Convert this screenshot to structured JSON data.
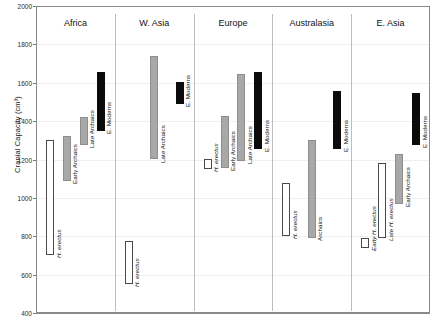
{
  "chart_data": {
    "type": "bar",
    "title": "",
    "xlabel": "",
    "ylabel": "Cranial Capacity (cm³)",
    "ylim": [
      400,
      2000
    ],
    "ytick_labels": [
      "400",
      "600",
      "800",
      "1000",
      "1200",
      "1400",
      "1600",
      "1800",
      "2000"
    ],
    "yticks": [
      400,
      600,
      800,
      1000,
      1200,
      1400,
      1600,
      1800,
      2000
    ],
    "grid": true,
    "legend": "none",
    "note": "Floating range bars: each bar spans min-max cranial capacity for a hominin group within a region.",
    "categories": [
      "Africa",
      "W. Asia",
      "Europe",
      "Australasia",
      "E. Asia"
    ],
    "fills": {
      "white": "#ffffff",
      "gray": "#a8a8a8",
      "black": "#0b0b0b"
    },
    "groups": [
      {
        "name": "Africa",
        "bars": [
          {
            "label": "H. erectus",
            "italic": true,
            "fill": "white",
            "min": 700,
            "max": 1300
          },
          {
            "label": "Early Archaics",
            "italic": false,
            "fill": "gray",
            "min": 1090,
            "max": 1325
          },
          {
            "label": "Late Archaics",
            "italic": false,
            "fill": "gray",
            "min": 1275,
            "max": 1420
          },
          {
            "label": "E. Moderns",
            "italic": false,
            "fill": "black",
            "min": 1350,
            "max": 1655
          }
        ]
      },
      {
        "name": "W. Asia",
        "bars": [
          {
            "label": "H. erectus",
            "italic": true,
            "fill": "white",
            "min": 550,
            "max": 775
          },
          {
            "label": "Late Archaics",
            "italic": false,
            "fill": "gray",
            "min": 1200,
            "max": 1740
          },
          {
            "label": "E. Moderns",
            "italic": false,
            "fill": "black",
            "min": 1490,
            "max": 1605
          }
        ]
      },
      {
        "name": "Europe",
        "bars": [
          {
            "label": "H. erectus",
            "italic": true,
            "fill": "white",
            "min": 1150,
            "max": 1205
          },
          {
            "label": "Early Archaics",
            "italic": false,
            "fill": "gray",
            "min": 1155,
            "max": 1425
          },
          {
            "label": "Late Archaics",
            "italic": false,
            "fill": "gray",
            "min": 1190,
            "max": 1645
          },
          {
            "label": "E. Moderns",
            "italic": false,
            "fill": "black",
            "min": 1255,
            "max": 1655
          }
        ]
      },
      {
        "name": "Australasia",
        "bars": [
          {
            "label": "H. erectus",
            "italic": true,
            "fill": "white",
            "min": 800,
            "max": 1080
          },
          {
            "label": "Archaics",
            "italic": false,
            "fill": "gray",
            "min": 790,
            "max": 1300
          },
          {
            "label": "E. Moderns",
            "italic": false,
            "fill": "black",
            "min": 1255,
            "max": 1555
          }
        ]
      },
      {
        "name": "E. Asia",
        "bars": [
          {
            "label": "Early H. erectus",
            "italic": true,
            "fill": "white",
            "min": 740,
            "max": 790
          },
          {
            "label": "Late H. erectus",
            "italic": true,
            "fill": "white",
            "min": 790,
            "max": 1180
          },
          {
            "label": "Early Archaics",
            "italic": false,
            "fill": "gray",
            "min": 970,
            "max": 1230
          },
          {
            "label": "E. Moderns",
            "italic": false,
            "fill": "black",
            "min": 1275,
            "max": 1545
          }
        ]
      }
    ]
  }
}
